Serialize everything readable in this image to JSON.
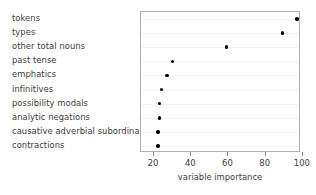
{
  "chart_data": {
    "type": "scatter",
    "title": "",
    "xlabel": "variable importance",
    "ylabel": "",
    "xlim": [
      13,
      99
    ],
    "grid": true,
    "legend": null,
    "xticks": [
      20,
      40,
      60,
      80,
      100
    ],
    "xtick_labels": [
      "20",
      "40",
      "60",
      "80",
      "100"
    ],
    "categories": [
      "tokens",
      "types",
      "other total nouns",
      "past tense",
      "emphatics",
      "infinitives",
      "possibility modals",
      "analytic negations",
      "causative adverbial subordinators",
      "contractions"
    ],
    "values": [
      97,
      89,
      59,
      30,
      27,
      24,
      23,
      23,
      22,
      22
    ],
    "points": [
      {
        "label": "tokens",
        "value": 97
      },
      {
        "label": "types",
        "value": 89
      },
      {
        "label": "other total nouns",
        "value": 59
      },
      {
        "label": "past tense",
        "value": 30
      },
      {
        "label": "emphatics",
        "value": 27
      },
      {
        "label": "infinitives",
        "value": 24
      },
      {
        "label": "possibility modals",
        "value": 23
      },
      {
        "label": "analytic negations",
        "value": 23
      },
      {
        "label": "causative adverbial subordinators",
        "value": 22
      },
      {
        "label": "contractions",
        "value": 22
      }
    ],
    "colors": {
      "point": "#000000",
      "frame": "#b0b0b0",
      "grid": "#f2f2f2",
      "text": "#3a3a3a",
      "background": "#ffffff"
    }
  }
}
